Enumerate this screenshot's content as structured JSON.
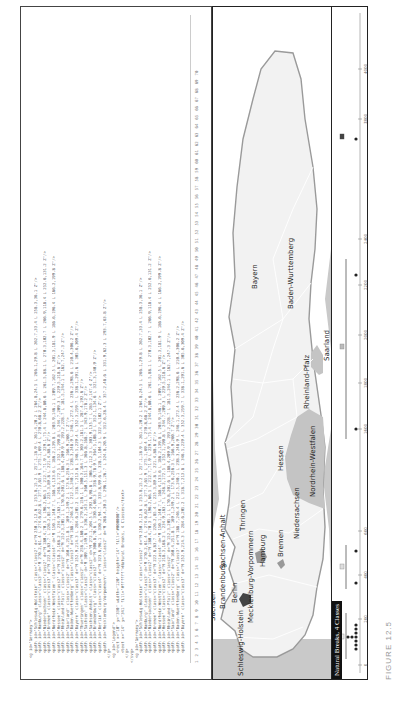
{
  "editor": {
    "code_lines": [
      "  <g id=\"Germany\">",
      "    <path id=\"Schleswig-Holstein\" class=\"class2\" d=\"M 250.3,12.6 L 253.8,15.2 L 257.1,18.9 L 261.4,20.2 L 264.8,24.5 L 266.1,29.8 L 262.7,33.4 L 258.3,36.1 Z\"/>",
      "    <path id=\"Hamburg\" class=\"class3\" d=\"M 270.2,61.4 L 274.6,62.8 L 277.3,65.9 L 275.1,69.4 L 270.8,68.2 Z\"/>",
      "    <path id=\"Niedersachsen\" class=\"class2\" d=\"M 180.4,70.3 L 196.2,66.5 L 212.7,71.9 L 229.1,75.4 L 244.8,80.6 L 261.5,88.1 L 270.3,102.7 L 266.9,118.4 L 252.6,131.2 Z\"/>",
      "    <path id=\"Bremen\" class=\"class3\" d=\"M 222.6,83.7 L 226.2,85.4 L 225.3,89.8 L 221.4,88.6 Z\"/>",
      "    <path id=\"Nordrhein-Westfalen\" class=\"class4\" d=\"M 150.1,140.7 L 168.4,133.6 L 186.2,139.8 L 203.9,146.1 L 209.7,162.5 L 201.3,181.9 L 186.6,196.4 L 166.2,199.8 Z\"/>",
      "    <path id=\"Hessen\" class=\"class2\" d=\"M 218.3,168.2 L 234.9,163.7 L 248.2,172.5 L 252.1,190.8 L 244.7,209.3 L 229.5,218.6 Z\"/>",
      "    <path id=\"Rheinland-Pfalz\" class=\"class2\" d=\"M 152.3,205.1 L 170.8,201.6 L 188.4,209.9 L 193.2,228.7 L 181.5,244.1 L 162.7,247.3 Z\"/>",
      "    <path id=\"Saarland\" class=\"class2\" d=\"M 160.4,251.8 L 169.1,249.2 L 173.6,256.3 L 166.9,260.7 Z\"/>",
      "    <path id=\"Baden-Wuerttemberg\" class=\"class3\" d=\"M 188.7,246.4 L 212.5,240.1 L 238.3,248.9 L 246.1,272.4 L 236.2,298.6 L 210.4,306.2 Z\"/>",
      "    <path id=\"Bayern\" class=\"class3\" d=\"M 252.9,214.3 L 284.6,205.2 L 318.7,213.8 L 346.5,229.4 L 352.3,259.7 L 338.1,291.6 L 305.6,309.4 Z\"/>",
      "    <path id=\"Thueringen\" class=\"class2\" d=\"M 258.4,160.2 L 279.6,156.1 L 300.3,164.7 L 303.2,181.5 L 287.4,192.6 Z\"/>",
      "    <path id=\"Sachsen\" class=\"class2\" d=\"M 309.7,149.6 L 336.2,143.1 L 360.5,151.3 L 366.8,168.7 L 343.9,178.2 Z\"/>",
      "    <path id=\"Sachsen-Anhalt\" class=\"class2\" d=\"M 272.1,104.5 L 292.6,98.8 L 306.4,112.3 L 303.9,135.7 L 285.2,147.4 Z\"/>",
      "    <path id=\"Brandenburg\" class=\"class2\" d=\"M 300.8,70.6 L 330.4,66.3 L 358.9,78.9 L 364.5,108.2 L 352.1,134.6 L 321.3,140.9 Z\"/>",
      "    <path id=\"Berlin\" class=\"class4\" d=\"M 323.6,96.1 L 330.2,94.7 L 333.8,99.6 L 328.5,104.3 L 322.4,102.1 Z\"/>",
      "    <path id=\"Mecklenburg-Vorpommern\" class=\"class2\" d=\"M 268.4,30.5 L 296.1,26.7 L 324.8,20.9 L 352.6,28.4 L 357.2,48.6 L 331.9,62.3 L 293.7,63.8 Z\"/>",
      "  </g>",
      "  <g id=\"Legend\">",
      "    <rect x=\"10\" y=\"330\" width=\"120\" height=\"14\" fill=\"#000000\"/>",
      "    <text x=\"14\" y=\"341\" fill=\"#ffffff\">Natural Breaks, 4 Classes</text>",
      "  </g>",
      "</svg>"
    ],
    "line_numbers": [
      "1",
      "2",
      "3",
      "4",
      "5",
      "6",
      "7",
      "8",
      "9",
      "10",
      "11",
      "12",
      "13",
      "14",
      "15",
      "16",
      "17",
      "18",
      "19",
      "20",
      "21",
      "22",
      "23",
      "24",
      "25",
      "26",
      "27",
      "28",
      "29",
      "30",
      "31",
      "32",
      "33",
      "34",
      "35",
      "36",
      "37",
      "38",
      "39",
      "40",
      "41",
      "42",
      "43",
      "44",
      "45",
      "46",
      "47",
      "48",
      "49",
      "50",
      "51",
      "52",
      "53",
      "54",
      "55",
      "56",
      "57",
      "58",
      "59",
      "60",
      "61",
      "62",
      "63",
      "64",
      "65",
      "66",
      "67",
      "68",
      "69",
      "70"
    ]
  },
  "map": {
    "title": "Natural Breaks, 4 Classes",
    "colors": {
      "sea": "#c9c9c9",
      "land_light": "#f2f2f2",
      "land_class2": "#ededed",
      "land_class4": "#bdbdbd",
      "land_class_max": "#444444",
      "border": "#ffffff",
      "outside": "#ffffff"
    },
    "regions": [
      {
        "name": "Schleswig-Holstein",
        "class": 2
      },
      {
        "name": "Hamburg",
        "class": 3
      },
      {
        "name": "Mecklenburg-Vorpommern",
        "class": 1
      },
      {
        "name": "Bremen",
        "class": 3
      },
      {
        "name": "Berlin",
        "class": 4
      },
      {
        "name": "Niedersachsen",
        "class": 1
      },
      {
        "name": "Brandenburg",
        "class": 1
      },
      {
        "name": "Sachsen-Anhalt",
        "class": 1
      },
      {
        "name": "Sachsen",
        "class": 1
      },
      {
        "name": "Nordrhein-Westfalen",
        "class": 2
      },
      {
        "name": "Hessen",
        "class": 1
      },
      {
        "name": "Thringen",
        "class": 1
      },
      {
        "name": "Rheinland-Pfalz",
        "class": 1
      },
      {
        "name": "Saarland",
        "class": 2
      },
      {
        "name": "Bayern",
        "class": 1
      },
      {
        "name": "Baden-Wurttemberg",
        "class": 1
      }
    ],
    "legend": {
      "axis_ticks": [
        "0",
        "200",
        "400",
        "600",
        "1600",
        "1800",
        "2000",
        "2200",
        "2400",
        "3800",
        "4000"
      ],
      "class_boxes": [
        "class-1",
        "class-2",
        "class-3",
        "class-4"
      ]
    }
  },
  "caption": "FIGURE 12.5"
}
